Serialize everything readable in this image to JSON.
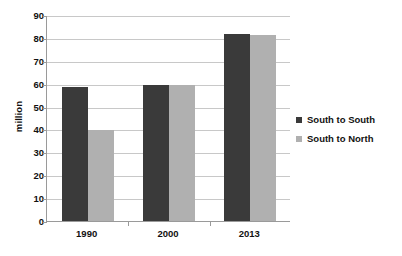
{
  "chart_data": {
    "type": "bar",
    "title": "",
    "xlabel": "",
    "ylabel": "million",
    "categories": [
      "1990",
      "2000",
      "2013"
    ],
    "series": [
      {
        "name": "South to South",
        "color": "#3a3a3a",
        "values": [
          59,
          60,
          82
        ]
      },
      {
        "name": "South to North",
        "color": "#b0b0b0",
        "values": [
          40,
          60,
          81.5
        ]
      }
    ],
    "ylim": [
      0,
      90
    ],
    "ytick_step": 10,
    "yticks": [
      0,
      10,
      20,
      30,
      40,
      50,
      60,
      70,
      80,
      90
    ],
    "ytick_labels": [
      "0",
      "10",
      "20",
      "30",
      "40",
      "50",
      "60",
      "70",
      "80",
      "90"
    ],
    "grid": "horizontal",
    "legend_position": "right",
    "background_color": "#ffffff",
    "gridline_color": "#c8c8c8",
    "axis_color": "#9a9a9a"
  },
  "legend": {
    "entries": [
      {
        "label": "South to South"
      },
      {
        "label": "South to North"
      }
    ]
  }
}
